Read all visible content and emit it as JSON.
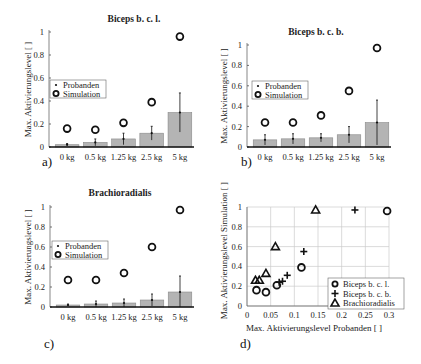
{
  "colors": {
    "bar_fill": "#b4b4b4",
    "bar_stroke": "#8a8a8a",
    "axis": "#111111",
    "grid": "#cccccc",
    "marker": "#111111"
  },
  "panels": [
    {
      "label": "a)"
    },
    {
      "label": "b)"
    },
    {
      "label": "c)"
    },
    {
      "label": "d)"
    }
  ],
  "chart_data": [
    {
      "type": "bar",
      "panel": "a)",
      "title": "Biceps b. c. l.",
      "xlabel": "",
      "ylabel": "Max. Aktivierungslevel [ ]",
      "categories": [
        "0 kg",
        "0.5 kg",
        "1.25 kg",
        "2.5 kg",
        "5 kg"
      ],
      "category_tick_text": [
        "0 kg",
        "0.5 kg",
        "1.25 kg",
        "2.5 kg",
        "5 kg"
      ],
      "ylim": [
        0,
        1
      ],
      "yticks": [
        "0",
        "0.2",
        "0.4",
        "0.6",
        "0.8",
        "1"
      ],
      "legend": [
        "Probanden",
        "Simulation"
      ],
      "series": [
        {
          "name": "Probanden",
          "values": [
            0.02,
            0.04,
            0.07,
            0.12,
            0.3
          ],
          "error": [
            0.01,
            0.03,
            0.05,
            0.06,
            0.17
          ]
        },
        {
          "name": "Simulation",
          "values": [
            0.16,
            0.15,
            0.21,
            0.39,
            0.96
          ]
        }
      ]
    },
    {
      "type": "bar",
      "panel": "b)",
      "title": "Biceps b. c. b.",
      "xlabel": "",
      "ylabel": "Max. Aktivierungslevel [ ]",
      "categories": [
        "0 kg",
        "0.5 kg",
        "1.25 kg",
        "2.5 kg",
        "5 kg"
      ],
      "ylim": [
        0,
        1
      ],
      "yticks": [
        "0",
        "0.2",
        "0.4",
        "0.6",
        "0.8",
        "1"
      ],
      "legend": [
        "Probanden",
        "Simulation"
      ],
      "series": [
        {
          "name": "Probanden",
          "values": [
            0.07,
            0.08,
            0.09,
            0.12,
            0.24
          ],
          "error": [
            0.05,
            0.05,
            0.04,
            0.08,
            0.22
          ]
        },
        {
          "name": "Simulation",
          "values": [
            0.24,
            0.24,
            0.31,
            0.55,
            0.97
          ]
        }
      ]
    },
    {
      "type": "bar",
      "panel": "c)",
      "title": "Brachioradialis",
      "xlabel": "",
      "ylabel": "Max. Aktivierungslevel [ ]",
      "categories": [
        "0 kg",
        "0.5 kg",
        "1.25 kg",
        "2.5 kg",
        "5 kg"
      ],
      "ylim": [
        0,
        1
      ],
      "yticks": [
        "0",
        "0.2",
        "0.4",
        "0.6",
        "0.8",
        "1"
      ],
      "legend": [
        "Probanden",
        "Simulation"
      ],
      "series": [
        {
          "name": "Probanden",
          "values": [
            0.02,
            0.03,
            0.04,
            0.07,
            0.15
          ],
          "error": [
            0.01,
            0.03,
            0.04,
            0.06,
            0.16
          ]
        },
        {
          "name": "Simulation",
          "values": [
            0.27,
            0.27,
            0.34,
            0.6,
            0.97
          ]
        }
      ]
    },
    {
      "type": "scatter",
      "panel": "d)",
      "title": "",
      "xlabel": "Max. Aktivierungslevel Probanden [ ]",
      "ylabel": "Max. Aktivierungslevel Simulation [ ]",
      "xlim": [
        0,
        0.3
      ],
      "ylim": [
        0,
        1
      ],
      "xticks": [
        "0",
        "0.05",
        "0.1",
        "0.15",
        "0.2",
        "0.25",
        "0.3"
      ],
      "yticks": [
        "0",
        "0.2",
        "0.4",
        "0.6",
        "0.8",
        "1"
      ],
      "grid": true,
      "legend": [
        "Biceps b. c. l.",
        "Biceps b. c. b.",
        "Brachioradialis"
      ],
      "legend_position": "lower right",
      "series": [
        {
          "name": "Biceps b. c. l.",
          "marker": "circle",
          "x": [
            0.02,
            0.04,
            0.063,
            0.115,
            0.296
          ],
          "y": [
            0.16,
            0.14,
            0.21,
            0.39,
            0.96
          ]
        },
        {
          "name": "Biceps b. c. b.",
          "marker": "plus",
          "x": [
            0.068,
            0.075,
            0.085,
            0.12,
            0.228
          ],
          "y": [
            0.24,
            0.25,
            0.31,
            0.55,
            0.97
          ]
        },
        {
          "name": "Brachioradialis",
          "marker": "triangle",
          "x": [
            0.018,
            0.026,
            0.04,
            0.06,
            0.145
          ],
          "y": [
            0.26,
            0.26,
            0.33,
            0.6,
            0.97
          ]
        }
      ]
    }
  ]
}
